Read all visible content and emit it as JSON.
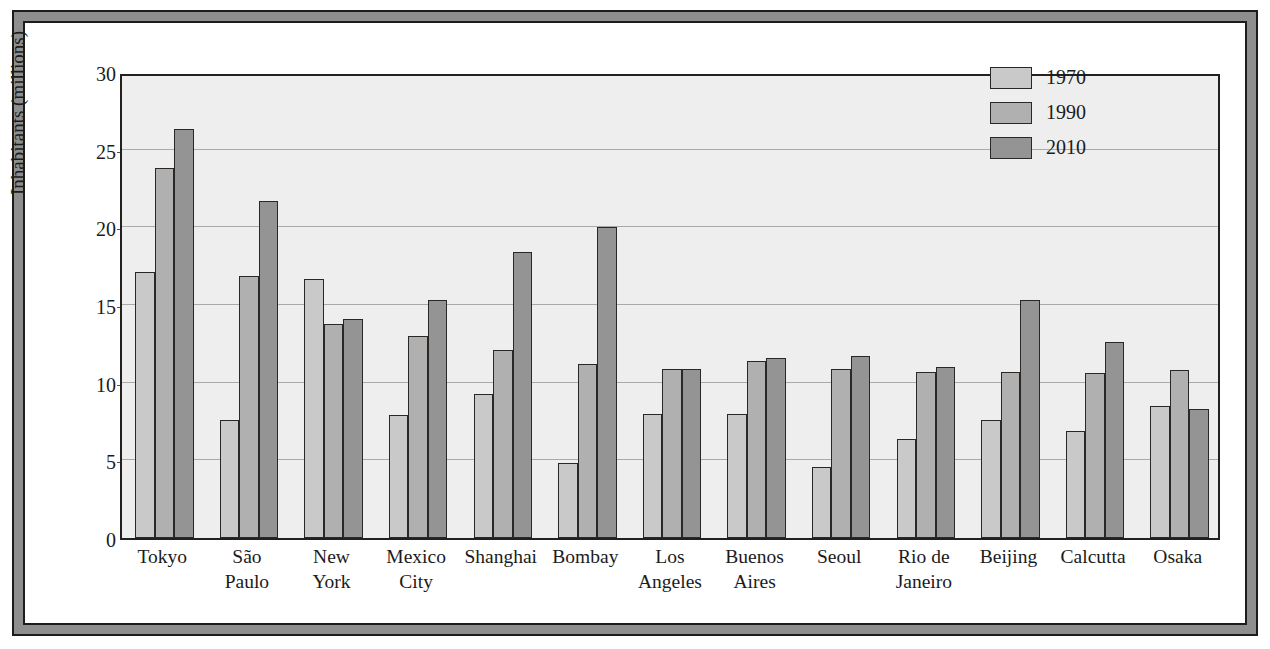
{
  "figure": {
    "frame_color": "#8e8e8e",
    "border_color": "#1c1c1c",
    "page_color": "#ffffff"
  },
  "chart_data": {
    "type": "bar",
    "title": "",
    "subtitle": "",
    "xlabel": "",
    "ylabel": "Inhabitants (millions)",
    "ylim": [
      0,
      30
    ],
    "yticks": [
      0,
      5,
      10,
      15,
      20,
      25,
      30
    ],
    "ytick_labels": [
      "0",
      "5",
      "10",
      "15",
      "20",
      "25",
      "30"
    ],
    "grid": true,
    "grid_axis": "y",
    "legend_position": "top-right",
    "plot_background": "#eeeeee",
    "categories": [
      "Tokyo",
      "São Paulo",
      "New York",
      "Mexico City",
      "Shanghai",
      "Bombay",
      "Los Angeles",
      "Buenos Aires",
      "Seoul",
      "Rio de Janeiro",
      "Beijing",
      "Calcutta",
      "Osaka"
    ],
    "category_lines": [
      [
        "Tokyo"
      ],
      [
        "São",
        "Paulo"
      ],
      [
        "New",
        "York"
      ],
      [
        "Mexico",
        "City"
      ],
      [
        "Shanghai"
      ],
      [
        "Bombay"
      ],
      [
        "Los",
        "Angeles"
      ],
      [
        "Buenos",
        "Aires"
      ],
      [
        "Seoul"
      ],
      [
        "Rio de",
        "Janeiro"
      ],
      [
        "Beijing"
      ],
      [
        "Calcutta"
      ],
      [
        "Osaka"
      ]
    ],
    "series": [
      {
        "name": "1970",
        "color": "#c9c9c9",
        "values": [
          17.1,
          7.6,
          16.7,
          7.9,
          9.3,
          4.8,
          8.0,
          8.0,
          4.6,
          6.4,
          7.6,
          6.9,
          8.5
        ]
      },
      {
        "name": "1990",
        "color": "#b0b0b0",
        "values": [
          23.8,
          16.9,
          13.8,
          13.0,
          12.1,
          11.2,
          10.9,
          11.4,
          10.9,
          10.7,
          10.7,
          10.6,
          10.8
        ]
      },
      {
        "name": "2010",
        "color": "#949494",
        "values": [
          26.3,
          21.7,
          14.1,
          15.3,
          18.4,
          20.0,
          10.9,
          11.6,
          11.7,
          11.0,
          15.3,
          12.6,
          8.3
        ]
      }
    ]
  },
  "legend": {
    "entries": [
      {
        "label": "1970",
        "swatch": "s0"
      },
      {
        "label": "1990",
        "swatch": "s1"
      },
      {
        "label": "2010",
        "swatch": "s2"
      }
    ]
  }
}
